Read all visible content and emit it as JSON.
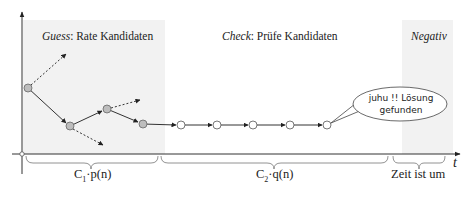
{
  "phases": {
    "guess": {
      "keyword": "Guess",
      "separator": ": ",
      "description": "Rate Kandidaten"
    },
    "check": {
      "keyword": "Check",
      "separator": ": ",
      "description": "Prüfe Kandidaten"
    },
    "negative": {
      "keyword": "Negativ"
    }
  },
  "bubble": {
    "line1": "juhu !! Lösung",
    "line2": "gefunden"
  },
  "axis": {
    "time_label": "t"
  },
  "braces": [
    {
      "label_main": "C",
      "label_sub": "1",
      "label_rest": "·p(n)"
    },
    {
      "label_main": "C",
      "label_sub": "2",
      "label_rest": "·q(n)"
    },
    {
      "label_main": "Zeit ist um"
    }
  ],
  "nodes": {
    "guess_filled": [
      {
        "x": 28,
        "y": 88
      },
      {
        "x": 70,
        "y": 126
      },
      {
        "x": 107,
        "y": 109
      },
      {
        "x": 143,
        "y": 124
      }
    ],
    "check_open": [
      {
        "x": 181,
        "y": 125
      },
      {
        "x": 217,
        "y": 125
      },
      {
        "x": 253,
        "y": 125
      },
      {
        "x": 290,
        "y": 125
      },
      {
        "x": 327,
        "y": 125
      }
    ]
  },
  "colors": {
    "shade": "#f2f2f2",
    "filled_node": "#bdbdbd",
    "line": "#333333"
  }
}
